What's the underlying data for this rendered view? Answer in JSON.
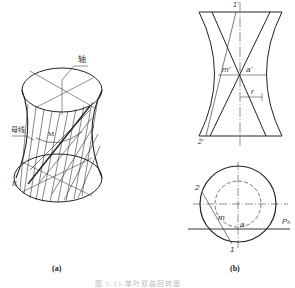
{
  "figure": {
    "caption": "图 5-21  单叶双曲回转面",
    "panel_a": {
      "caption": "(a)",
      "labels": {
        "axis": "轴",
        "generatrix": "母线",
        "point_m": "M",
        "line_ii": "II"
      }
    },
    "panel_b": {
      "caption": "(b)",
      "front_view_labels": {
        "top": "1'",
        "bottom": "2'",
        "m_prime": "m'",
        "a_prime": "a'",
        "radius": "r"
      },
      "top_view_labels": {
        "point_2": "2",
        "point_1": "1",
        "point_m": "m",
        "point_a": "a",
        "plane": "Pₕ"
      }
    }
  }
}
